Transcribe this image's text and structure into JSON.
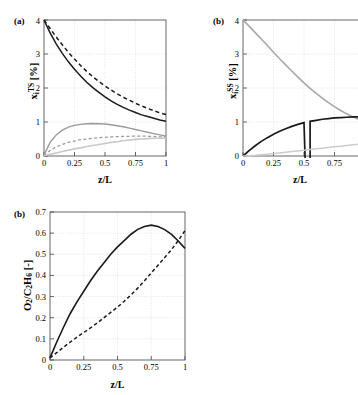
{
  "figure": {
    "panels": [
      {
        "tag": "(a)",
        "xlabel": "z/L",
        "ylabel_html": "x<sub>i</sub><sup>TS</sup>  [%]",
        "ylabel_text": "x_i^TS [%]",
        "xticks": [
          "0",
          "0.25",
          "0.5",
          "0.75",
          "1"
        ],
        "yticks": [
          "0",
          "1",
          "2",
          "3",
          "4"
        ]
      },
      {
        "tag": "(b)",
        "xlabel": "z/L",
        "ylabel_html": "x<sub>i</sub><sup>SS</sup>  [%]",
        "ylabel_text": "x_i^SS [%]",
        "xticks": [
          "0",
          "0.25",
          "0.5",
          "0.75"
        ],
        "yticks": [
          "0",
          "1",
          "2",
          "3",
          "4"
        ]
      },
      {
        "tag": "(b)",
        "xlabel": "z/L",
        "ylabel_html": "O<sub>2</sub>/C<sub>2</sub>H<sub>6</sub>  [-]",
        "ylabel_text": "O2/C2H6 [-]",
        "xticks": [
          "0",
          "0.25",
          "0.5",
          "0.75",
          "1"
        ],
        "yticks": [
          "0",
          "0.1",
          "0.2",
          "0.3",
          "0.4",
          "0.5",
          "0.6",
          "0.7"
        ]
      }
    ]
  },
  "chart_data": [
    {
      "type": "line",
      "title": "(a)",
      "xlabel": "z/L",
      "ylabel": "x_i^TS [%]",
      "xlim": [
        0,
        1
      ],
      "ylim": [
        0,
        4
      ],
      "xticks": [
        0,
        0.25,
        0.5,
        0.75,
        1
      ],
      "yticks": [
        0,
        1,
        2,
        3,
        4
      ],
      "grid": true,
      "legend": "none",
      "x": [
        0,
        0.05,
        0.1,
        0.15,
        0.2,
        0.25,
        0.3,
        0.35,
        0.4,
        0.45,
        0.5,
        0.55,
        0.6,
        0.65,
        0.7,
        0.75,
        0.8,
        0.85,
        0.9,
        0.95,
        1
      ],
      "series": [
        {
          "name": "curve-1-solid-black",
          "style": "solid",
          "color": "#1a1a1a",
          "values": [
            4.0,
            3.62,
            3.3,
            3.02,
            2.77,
            2.55,
            2.35,
            2.17,
            2.01,
            1.87,
            1.74,
            1.62,
            1.52,
            1.43,
            1.35,
            1.28,
            1.21,
            1.16,
            1.11,
            1.06,
            1.02
          ]
        },
        {
          "name": "curve-2-dashed-black",
          "style": "dashed",
          "color": "#1a1a1a",
          "values": [
            4.0,
            3.75,
            3.5,
            3.27,
            3.05,
            2.85,
            2.66,
            2.49,
            2.33,
            2.19,
            2.06,
            1.94,
            1.83,
            1.73,
            1.64,
            1.55,
            1.47,
            1.4,
            1.33,
            1.27,
            1.22
          ]
        },
        {
          "name": "curve-3-solid-gray",
          "style": "solid",
          "color": "#9a9a9a",
          "values": [
            0.03,
            0.4,
            0.62,
            0.76,
            0.85,
            0.9,
            0.93,
            0.95,
            0.955,
            0.95,
            0.94,
            0.92,
            0.89,
            0.86,
            0.82,
            0.78,
            0.74,
            0.7,
            0.66,
            0.62,
            0.58
          ]
        },
        {
          "name": "curve-4-dashed-gray",
          "style": "dashed",
          "color": "#9a9a9a",
          "values": [
            0.02,
            0.16,
            0.27,
            0.34,
            0.4,
            0.44,
            0.48,
            0.5,
            0.52,
            0.54,
            0.55,
            0.56,
            0.57,
            0.575,
            0.58,
            0.585,
            0.585,
            0.58,
            0.575,
            0.565,
            0.55
          ]
        },
        {
          "name": "curve-5-solid-lightgray",
          "style": "solid",
          "color": "#c8c8c8",
          "values": [
            0.01,
            0.05,
            0.09,
            0.13,
            0.17,
            0.21,
            0.24,
            0.28,
            0.31,
            0.34,
            0.37,
            0.4,
            0.42,
            0.45,
            0.47,
            0.49,
            0.5,
            0.51,
            0.52,
            0.52,
            0.52
          ]
        }
      ]
    },
    {
      "type": "line",
      "title": "(b)",
      "xlabel": "z/L",
      "ylabel": "x_i^SS [%]",
      "xlim": [
        0,
        1
      ],
      "ylim": [
        0,
        4
      ],
      "xticks": [
        0,
        0.25,
        0.5,
        0.75
      ],
      "yticks": [
        0,
        1,
        2,
        3,
        4
      ],
      "grid": true,
      "legend": "none",
      "note": "right portion of panel is cropped by the figure edge",
      "x": [
        0,
        0.05,
        0.1,
        0.15,
        0.2,
        0.25,
        0.3,
        0.35,
        0.4,
        0.45,
        0.5,
        0.55,
        0.6,
        0.65,
        0.7,
        0.75,
        0.8,
        0.85,
        0.9,
        0.95,
        1
      ],
      "series": [
        {
          "name": "curve-1-gray-descending",
          "style": "solid",
          "color": "#a8a8a8",
          "values": [
            4.0,
            3.82,
            3.63,
            3.44,
            3.25,
            3.05,
            2.86,
            2.68,
            2.5,
            2.32,
            2.15,
            1.99,
            1.84,
            1.7,
            1.57,
            1.45,
            1.34,
            1.24,
            1.15,
            1.07,
            1.0
          ]
        },
        {
          "name": "curve-2-black-ascending",
          "style": "solid",
          "color": "#1a1a1a",
          "values": [
            0.0,
            0.16,
            0.3,
            0.43,
            0.54,
            0.64,
            0.73,
            0.8,
            0.87,
            0.93,
            0.98,
            1.02,
            1.05,
            1.08,
            1.1,
            1.12,
            1.13,
            1.14,
            1.15,
            1.15,
            1.16
          ]
        },
        {
          "name": "curve-3-lightgray-ascending",
          "style": "solid",
          "color": "#cccccc",
          "values": [
            0.0,
            0.01,
            0.02,
            0.04,
            0.05,
            0.07,
            0.09,
            0.11,
            0.13,
            0.15,
            0.17,
            0.19,
            0.21,
            0.23,
            0.25,
            0.27,
            0.29,
            0.31,
            0.33,
            0.35,
            0.37
          ]
        }
      ]
    },
    {
      "type": "line",
      "title": "(b)",
      "xlabel": "z/L",
      "ylabel": "O2/C2H6 [-]",
      "xlim": [
        0,
        1
      ],
      "ylim": [
        0,
        0.7
      ],
      "xticks": [
        0,
        0.25,
        0.5,
        0.75,
        1
      ],
      "yticks": [
        0,
        0.1,
        0.2,
        0.3,
        0.4,
        0.5,
        0.6,
        0.7
      ],
      "grid": true,
      "legend": "none",
      "x": [
        0,
        0.05,
        0.1,
        0.15,
        0.2,
        0.25,
        0.3,
        0.35,
        0.4,
        0.45,
        0.5,
        0.55,
        0.6,
        0.65,
        0.7,
        0.75,
        0.8,
        0.85,
        0.9,
        0.95,
        1
      ],
      "series": [
        {
          "name": "curve-1-solid-black",
          "style": "solid",
          "color": "#1a1a1a",
          "values": [
            0.01,
            0.085,
            0.155,
            0.22,
            0.275,
            0.325,
            0.375,
            0.42,
            0.46,
            0.5,
            0.535,
            0.565,
            0.595,
            0.618,
            0.632,
            0.638,
            0.632,
            0.617,
            0.594,
            0.563,
            0.528
          ]
        },
        {
          "name": "curve-2-dashed-black",
          "style": "dashed",
          "color": "#1a1a1a",
          "values": [
            0.01,
            0.035,
            0.06,
            0.085,
            0.108,
            0.13,
            0.152,
            0.175,
            0.2,
            0.225,
            0.25,
            0.278,
            0.308,
            0.34,
            0.375,
            0.412,
            0.448,
            0.485,
            0.522,
            0.565,
            0.612
          ]
        }
      ]
    }
  ]
}
